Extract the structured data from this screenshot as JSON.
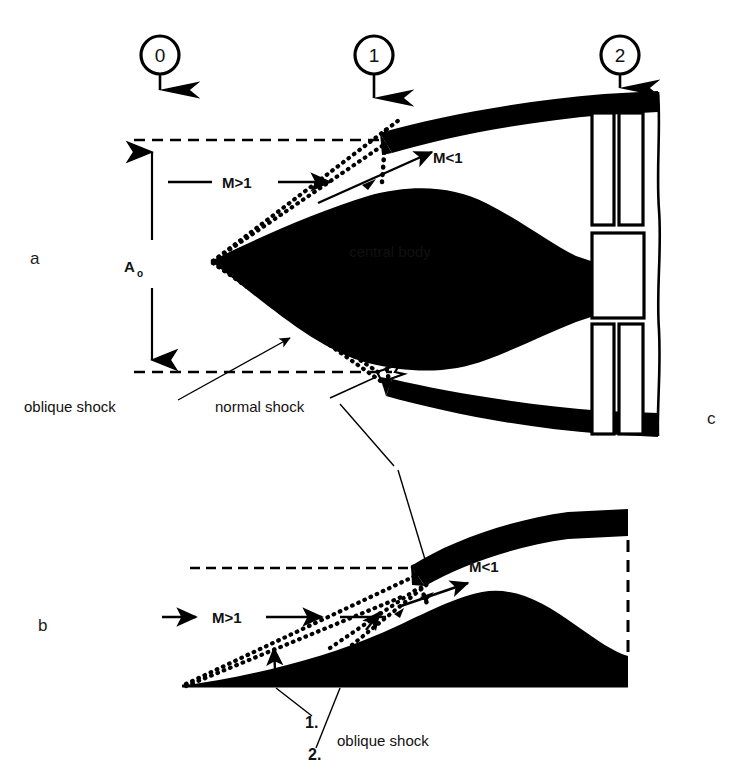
{
  "figure": {
    "background_color": "#ffffff",
    "ink_color": "#000000"
  },
  "station_markers": [
    {
      "id": "station-0",
      "label": "0",
      "cx": 160,
      "cy": 55,
      "r": 19,
      "arrow_y_end": 97
    },
    {
      "id": "station-1",
      "label": "1",
      "cx": 374,
      "cy": 55,
      "r": 19,
      "arrow_y_end": 105
    },
    {
      "id": "station-2",
      "label": "2",
      "cx": 620,
      "cy": 55,
      "r": 19,
      "arrow_y_end": 95
    }
  ],
  "panels": [
    {
      "id": "panel-a",
      "label": "a",
      "x": 30,
      "y": 258
    },
    {
      "id": "panel-b",
      "label": "b",
      "x": 38,
      "y": 625
    },
    {
      "id": "panel-c",
      "label": "c",
      "x": 707,
      "y": 418
    }
  ],
  "panel_a": {
    "dimension": {
      "label": "A",
      "subscript": "o",
      "label_x": 124,
      "label_y": 272,
      "sub_dx": 11,
      "sub_dy": 5
    },
    "flow_labels": [
      {
        "id": "mach-supersonic-a",
        "text": "M>1",
        "x": 186,
        "y": 187
      },
      {
        "id": "mach-subsonic-a",
        "text": "M<1",
        "x": 433,
        "y": 163
      }
    ],
    "body_label": {
      "id": "central-body-label",
      "text": "central body",
      "x": 320,
      "y": 252
    },
    "callouts": [
      {
        "id": "oblique-shock-callout-a",
        "text": "oblique shock",
        "x": 24,
        "y": 412
      },
      {
        "id": "normal-shock-callout-a",
        "text": "normal shock",
        "x": 215,
        "y": 412
      }
    ]
  },
  "panel_b": {
    "flow_labels": [
      {
        "id": "mach-supersonic-b",
        "text": "M>1",
        "x": 210,
        "y": 622
      },
      {
        "id": "mach-subsonic-b",
        "text": "M<1",
        "x": 469,
        "y": 572
      }
    ],
    "callouts": [
      {
        "id": "shock-item-1",
        "text": "1.",
        "x": 305,
        "y": 723
      },
      {
        "id": "shock-item-2",
        "text": "2.",
        "x": 308,
        "y": 755
      },
      {
        "id": "oblique-shock-callout-b",
        "text": "oblique shock",
        "x": 337,
        "y": 740
      }
    ]
  },
  "icons": {
    "station_arrow": "down-arrow-icon",
    "flow_arrow": "right-arrow-icon",
    "dimension_arrow": "double-headed-vertical-arrow-icon"
  }
}
